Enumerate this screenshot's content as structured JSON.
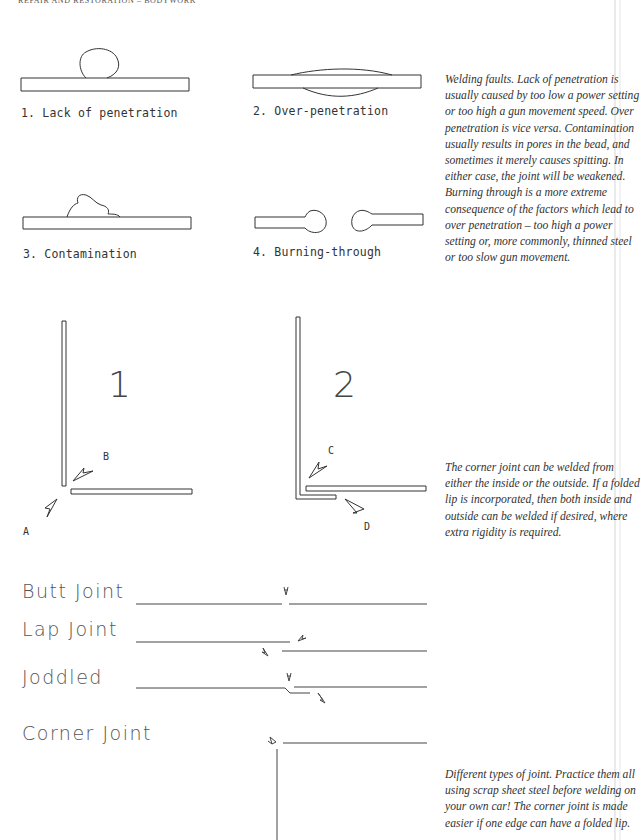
{
  "page": {
    "running_head": "Repair and restoration – Bodywork"
  },
  "figure_faults": {
    "labels": [
      "1. Lack of penetration",
      "2. Over-penetration",
      "3. Contamination",
      "4. Burning-through"
    ],
    "caption": "Welding faults. Lack of penetration is usually caused by too low a power setting or too high a gun movement speed. Over penetration is vice versa. Contamination usually results in pores in the bead, and sometimes it merely causes spitting. In either case, the joint will be weakened. Burning through is a more extreme consequence of the factors which lead to over penetration – too high a power setting or, more commonly, thinned steel or too slow gun movement."
  },
  "figure_corner": {
    "numbers": [
      "1",
      "2"
    ],
    "arrow_letters": [
      "A",
      "B",
      "C",
      "D"
    ],
    "caption": "The corner joint can be welded from either the inside or the outside. If a folded lip is incorporated, then both inside and outside can be welded if desired, where extra rigidity is required."
  },
  "figure_joints": {
    "labels": [
      "Butt Joint",
      "Lap Joint",
      "Joddled",
      "Corner Joint"
    ],
    "caption": "Different types of joint. Practice them all using scrap sheet steel before welding on your own car! The corner joint is made easier if one edge can have a folded lip."
  }
}
